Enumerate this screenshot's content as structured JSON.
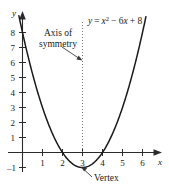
{
  "chart_data": {
    "type": "line",
    "title": "",
    "equation_label": "y = x² − 6x + 8",
    "equation_parts": {
      "y": "y",
      "equals": "=",
      "x": "x",
      "exponent": "2",
      "middle": "− 6",
      "x2": "x",
      "constant": "+ 8"
    },
    "xlabel": "x",
    "ylabel": "y",
    "xlim": [
      -0.35,
      6.9
    ],
    "ylim": [
      -1.6,
      8.8
    ],
    "x_ticks": [
      1,
      2,
      3,
      4,
      5,
      6
    ],
    "x_tick_labels": [
      "1",
      "2",
      "3",
      "4",
      "5",
      "6"
    ],
    "y_ticks": [
      1,
      2,
      3,
      4,
      5,
      6,
      7,
      8,
      -1
    ],
    "y_tick_labels": [
      "1",
      "2",
      "3",
      "4",
      "5",
      "6",
      "7",
      "8",
      "–1"
    ],
    "grid": false,
    "legend": "none",
    "curve": {
      "name": "y = x^2 - 6x + 8",
      "color": "#1a1a1a",
      "a": 1,
      "b": -6,
      "c": 8,
      "x_start": -0.3,
      "x_end": 6.2,
      "points": [
        {
          "x": -0.3,
          "y": 9.89
        },
        {
          "x": 0.0,
          "y": 8.0
        },
        {
          "x": 0.5,
          "y": 5.25
        },
        {
          "x": 1.0,
          "y": 3.0
        },
        {
          "x": 1.5,
          "y": 1.25
        },
        {
          "x": 2.0,
          "y": 0.0
        },
        {
          "x": 2.5,
          "y": -0.75
        },
        {
          "x": 3.0,
          "y": -1.0
        },
        {
          "x": 3.5,
          "y": -0.75
        },
        {
          "x": 4.0,
          "y": 0.0
        },
        {
          "x": 4.5,
          "y": 1.25
        },
        {
          "x": 5.0,
          "y": 3.0
        },
        {
          "x": 5.5,
          "y": 5.25
        },
        {
          "x": 6.0,
          "y": 8.0
        },
        {
          "x": 6.2,
          "y": 9.44
        }
      ]
    },
    "annotations": [
      {
        "name": "axis-of-symmetry",
        "text_line1": "Axis of",
        "text_line2": "symmetry",
        "x_value": 3,
        "style": "dotted-vertical-line-with-arrow"
      },
      {
        "name": "vertex",
        "text": "Vertex",
        "x_value": 3,
        "y_value": -1,
        "style": "arrow-label"
      }
    ]
  },
  "axis_of_symmetry": {
    "line1": "Axis of",
    "line2": "symmetry"
  },
  "vertex": {
    "label": "Vertex"
  }
}
